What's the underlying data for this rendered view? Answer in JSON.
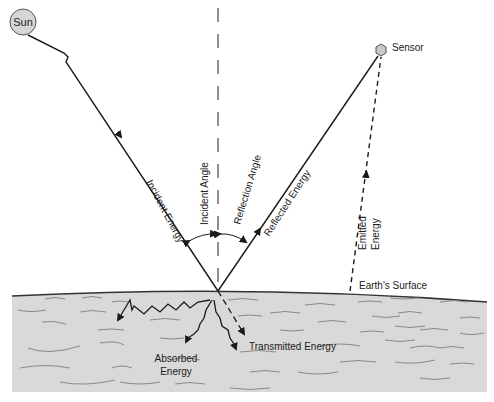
{
  "labels": {
    "sun": "Sun",
    "sensor": "Sensor",
    "incident_angle": "Incident Angle",
    "reflection_angle": "Reflection Angle",
    "incident_energy": "Incident Energy",
    "reflected_energy": "Reflected Energy",
    "emitted_energy_line1": "Emitted",
    "emitted_energy_line2": "Energy",
    "earths_surface": "Earth's Surface",
    "absorbed_energy_line1": "Absorbed",
    "absorbed_energy_line2": "Energy",
    "transmitted_energy": "Transmitted Energy"
  },
  "colors": {
    "line": "#1a1a1a",
    "sun_fill": "#d6d6d6",
    "sensor_fill": "#c8c8c8",
    "earth_fill": "#d9d9d9",
    "earth_texture": "#8a8a8a"
  }
}
